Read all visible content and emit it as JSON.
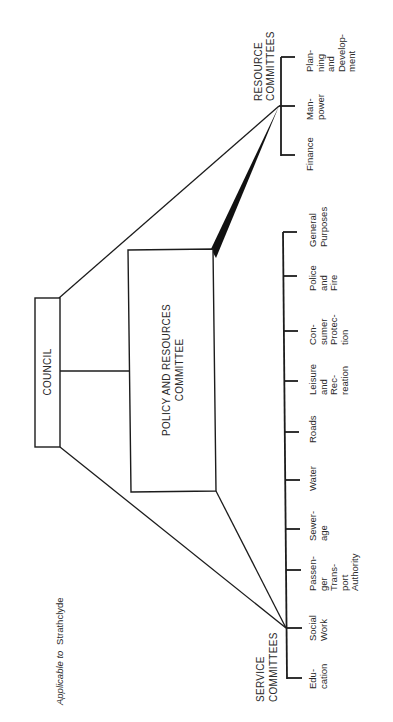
{
  "caption": {
    "italic": "Applicable to",
    "normal": "Strathclyde"
  },
  "council": {
    "label": "COUNCIL"
  },
  "policy": {
    "lines": [
      "POLICY AND RESOURCES",
      "COMMITTEE"
    ]
  },
  "resource_committees": {
    "heading": [
      "RESOURCE",
      "COMMITTEES"
    ],
    "items": [
      {
        "name": "Finance",
        "lines": [
          "Finance"
        ]
      },
      {
        "name": "Manpower",
        "lines": [
          "Man-",
          "power"
        ]
      },
      {
        "name": "Planning and Development",
        "lines": [
          "Plan-",
          "ning",
          "and",
          "Develop-",
          "ment"
        ]
      }
    ]
  },
  "service_committees": {
    "heading": [
      "SERVICE",
      "COMMITTEES"
    ],
    "items": [
      {
        "name": "Education",
        "lines": [
          "Edu-",
          "cation"
        ]
      },
      {
        "name": "Social Work",
        "lines": [
          "Social",
          "Work"
        ]
      },
      {
        "name": "Passenger Transport Authority",
        "lines": [
          "Passen-",
          "ger",
          "Trans-",
          "port",
          "Authority"
        ]
      },
      {
        "name": "Sewerage",
        "lines": [
          "Sewer-",
          "age"
        ]
      },
      {
        "name": "Water",
        "lines": [
          "Water"
        ]
      },
      {
        "name": "Roads",
        "lines": [
          "Roads"
        ]
      },
      {
        "name": "Leisure and Recreation",
        "lines": [
          "Leisure",
          "and",
          "Rec-",
          "reation"
        ]
      },
      {
        "name": "Consumer Protection",
        "lines": [
          "Con-",
          "sumer",
          "Protec-",
          "tion"
        ]
      },
      {
        "name": "Police and Fire",
        "lines": [
          "Police",
          "and",
          "Fire"
        ]
      },
      {
        "name": "General Purposes",
        "lines": [
          "General",
          "Purposes"
        ]
      }
    ]
  }
}
